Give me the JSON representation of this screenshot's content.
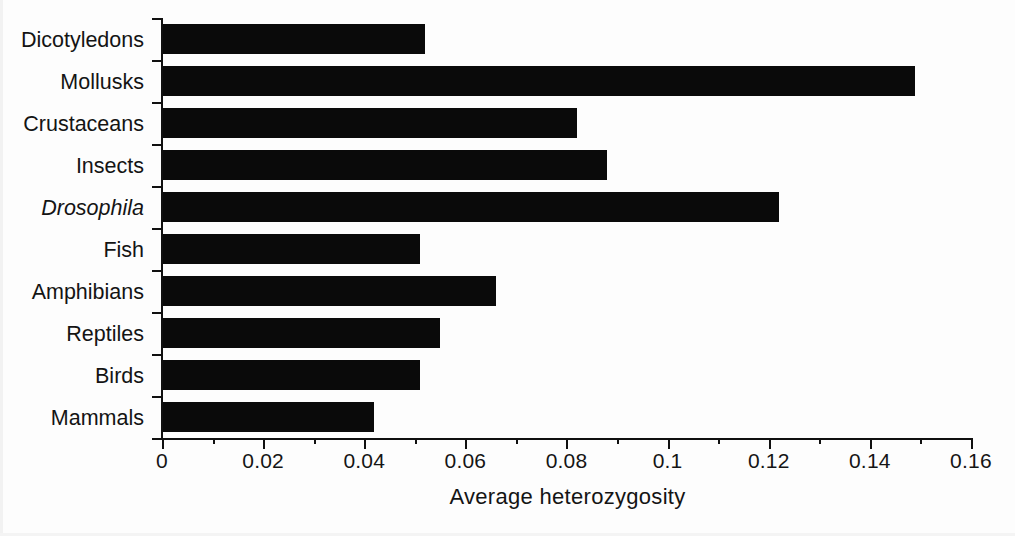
{
  "chart_data": {
    "type": "bar",
    "orientation": "horizontal",
    "title": "",
    "xlabel": "Average heterozygosity",
    "ylabel": "",
    "xlim": [
      0,
      0.16
    ],
    "xticks": [
      "0",
      "0.02",
      "0.04",
      "0.06",
      "0.08",
      "0.1",
      "0.12",
      "0.14",
      "0.16"
    ],
    "xtick_values": [
      0,
      0.02,
      0.04,
      0.06,
      0.08,
      0.1,
      0.12,
      0.14,
      0.16
    ],
    "minor_tick_step": 0.01,
    "grid": false,
    "legend": null,
    "bar_color": "#0a0a0a",
    "categories": [
      "Dicotyledons",
      "Mollusks",
      "Crustaceans",
      "Insects",
      "Drosophila",
      "Fish",
      "Amphibians",
      "Reptiles",
      "Birds",
      "Mammals"
    ],
    "categories_italic": [
      false,
      false,
      false,
      false,
      true,
      false,
      false,
      false,
      false,
      false
    ],
    "values": [
      0.052,
      0.149,
      0.082,
      0.088,
      0.122,
      0.051,
      0.066,
      0.055,
      0.051,
      0.042
    ]
  }
}
